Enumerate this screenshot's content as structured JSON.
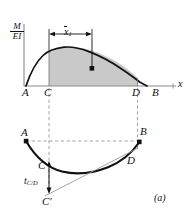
{
  "figure": {
    "caption": "(a)",
    "upper_diagram": {
      "y_axis_label_numerator": "M",
      "y_axis_label_denominator": "EI",
      "x_axis_label": "x",
      "dimension_label": "x",
      "dimension_label_subscript": "1",
      "point_labels": [
        "A",
        "C",
        "D",
        "B"
      ],
      "centroid_marker": "centroid-dot",
      "shaded_region": "area between C and D under M/EI curve"
    },
    "lower_diagram": {
      "point_labels": [
        "A",
        "B",
        "C",
        "D"
      ],
      "deviation_label": "t",
      "deviation_subscript": "C/D",
      "tangent_point_label": "C",
      "tangent_point_prime": "′"
    }
  },
  "colors": {
    "shade_fill": "#c9c9c9",
    "curve": "#111111",
    "axis": "#8a8a8a",
    "dashed": "#9a9a9a",
    "tangent": "#9a9a9a"
  }
}
